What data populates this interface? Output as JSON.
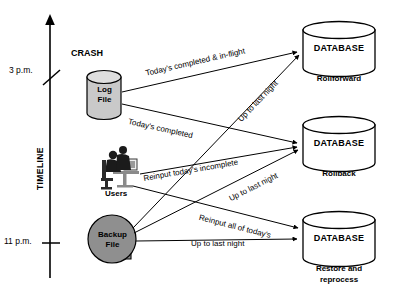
{
  "diagram": {
    "timeline": {
      "axis_label": "TIMELINE",
      "ticks": [
        {
          "label": "3 p.m."
        },
        {
          "label": "11 p.m."
        }
      ],
      "event_label": "CRASH"
    },
    "sources": [
      {
        "id": "log-file",
        "line1": "Log",
        "line2": "File",
        "shape": "cylinder",
        "fill": "#c9c9c9"
      },
      {
        "id": "users",
        "label": "Users",
        "shape": "clipart-people"
      },
      {
        "id": "backup-file",
        "line1": "Backup",
        "line2": "File",
        "shape": "tape-reel",
        "fill": "#8f8f8f"
      }
    ],
    "databases": [
      {
        "id": "db-rollforward",
        "title": "DATABASE",
        "subtitle": "Rollforward"
      },
      {
        "id": "db-rollback",
        "title": "DATABASE",
        "subtitle": "Rollback"
      },
      {
        "id": "db-restore",
        "title": "DATABASE",
        "subtitle_line1": "Restore and",
        "subtitle_line2": "reprocess"
      }
    ],
    "edges": [
      {
        "id": "edge-log-rollforward",
        "label": "Today's completed & in-flight",
        "from": "log-file",
        "to": "db-rollforward"
      },
      {
        "id": "edge-log-rollback",
        "label": "Today's completed",
        "from": "log-file",
        "to": "db-rollback"
      },
      {
        "id": "edge-backup-rollforward",
        "label": "Up to last night",
        "from": "backup-file",
        "to": "db-rollforward"
      },
      {
        "id": "edge-users-rollback",
        "label": "Reinput today's incomplete",
        "from": "users",
        "to": "db-rollback"
      },
      {
        "id": "edge-backup-rollback",
        "label": "Up to last night",
        "from": "backup-file",
        "to": "db-rollback"
      },
      {
        "id": "edge-users-restore",
        "label": "Reinput all of today's",
        "from": "users",
        "to": "db-restore"
      },
      {
        "id": "edge-backup-restore",
        "label": "Up to last night",
        "from": "backup-file",
        "to": "db-restore"
      }
    ],
    "colors": {
      "stroke": "#000000",
      "log_fill": "#c9c9c9",
      "backup_fill": "#8f8f8f",
      "db_fill": "#ffffff",
      "background": "#ffffff"
    }
  }
}
